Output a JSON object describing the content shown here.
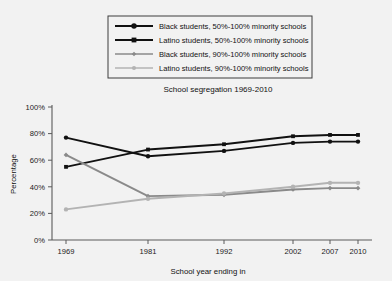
{
  "chart_data": {
    "type": "line",
    "title": "School segregation 1969-2010",
    "xlabel": "School year ending in",
    "ylabel": "Percentage",
    "categories": [
      "1969",
      "1981",
      "1992",
      "2002",
      "2007",
      "2010"
    ],
    "x": [
      1969,
      1981,
      1992,
      2002,
      2007,
      2010
    ],
    "ylim": [
      0,
      100
    ],
    "yticks": [
      "0%",
      "20%",
      "40%",
      "60%",
      "80%",
      "100%"
    ],
    "ytick_values": [
      0,
      20,
      40,
      60,
      80,
      100
    ],
    "grid": false,
    "legend_position": "above-plot",
    "series": [
      {
        "name": "Black students, 50%-100% minority schools",
        "values": [
          77,
          63,
          67,
          73,
          74,
          74
        ],
        "color": "#111111",
        "marker": "circle"
      },
      {
        "name": "Latino students, 50%-100% minority schools",
        "values": [
          55,
          68,
          72,
          78,
          79,
          79
        ],
        "color": "#111111",
        "marker": "square"
      },
      {
        "name": "Black students, 90%-100% minority schools",
        "values": [
          64,
          33,
          34,
          38,
          39,
          39
        ],
        "color": "#8a8a8a",
        "marker": "diamond"
      },
      {
        "name": "Latino students, 90%-100% minority schools",
        "values": [
          23,
          31,
          35,
          40,
          43,
          43
        ],
        "color": "#b3b3b3",
        "marker": "circle"
      }
    ]
  },
  "colors": {
    "background": "#f2f2f2",
    "axis": "#5a5a5a",
    "text": "#1a1a1a",
    "legend_border": "#3c3c3c",
    "legend_background": "#f2f2f2"
  }
}
